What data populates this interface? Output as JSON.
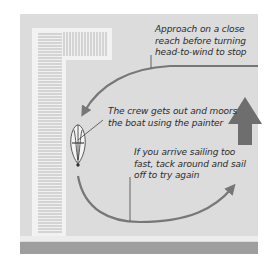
{
  "diagram": {
    "type": "sailing-manoeuvre",
    "colors": {
      "water": "#dcdcdc",
      "dock_fill": "#d2d2d2",
      "dock_edge": "#f2f2f2",
      "dock_slats": "#bdbdbd",
      "shore_band": "#9e9e9e",
      "arrow": "#777777",
      "wind_arrow": "#6e6e6e",
      "leader_line": "#444444",
      "text": "#2b2b2b"
    },
    "captions": {
      "approach": "Approach on a close\nreach before turning\nhead-to-wind to stop",
      "moor": "The crew gets out and moors\nthe boat using the painter",
      "retry": "If you arrive sailing too\nfast, tack around and sail\noff to try again"
    },
    "elements": {
      "dock": "L-shaped pontoon",
      "boat": "dinghy moored alongside",
      "wind": "wind-direction arrow (upward)",
      "approach_path": "curved arrow from right to dock",
      "retry_path": "curved arrow from boat sweeping right"
    }
  }
}
